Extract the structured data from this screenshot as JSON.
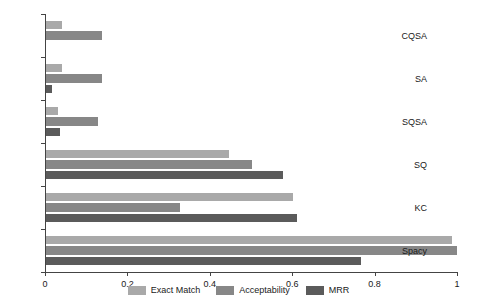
{
  "chart_data": {
    "type": "bar",
    "orientation": "horizontal",
    "title": "",
    "xlabel": "",
    "ylabel": "",
    "xlim": [
      0,
      1
    ],
    "ylim": null,
    "grid": false,
    "legend_position": "bottom-center",
    "categories": [
      "CQSA",
      "SA",
      "SQSA",
      "SQ",
      "KC",
      "Spacy"
    ],
    "xticks": [
      0,
      0.2,
      0.4,
      0.6,
      0.8,
      1
    ],
    "xtick_labels": [
      "0",
      "0.2",
      "0.4",
      "0.6",
      "0.8",
      "1"
    ],
    "series": [
      {
        "name": "Exact Match",
        "color": "#a9a9a9",
        "values": [
          0.04,
          0.04,
          0.03,
          0.445,
          0.6,
          0.985
        ]
      },
      {
        "name": "Acceptability",
        "color": "#878787",
        "values": [
          0.135,
          0.135,
          0.125,
          0.5,
          0.325,
          0.998
        ]
      },
      {
        "name": "MRR",
        "color": "#5b5b5b",
        "values": [
          0.0,
          0.015,
          0.035,
          0.575,
          0.61,
          0.765
        ]
      }
    ]
  },
  "axis": {
    "tick_color": "#444444",
    "label_color": "#1a1a1a"
  }
}
